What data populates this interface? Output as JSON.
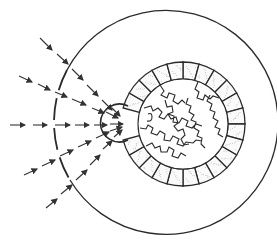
{
  "diagram": {
    "title": "",
    "colors": {
      "line": "#2a2a2a",
      "arrow": "#333333",
      "background": "#ffffff",
      "stipple": "#9a9a9a"
    },
    "outer_envelope": {
      "cx": 172,
      "cy": 122,
      "r": 112,
      "dashed_side": "left"
    },
    "capture_sphere": {
      "cx": 118,
      "cy": 122,
      "r": 19
    },
    "ring": {
      "cx": 183,
      "cy": 124,
      "r_outer": 62,
      "r_inner": 45,
      "segment_count": 24,
      "stippled": true
    },
    "inner_cells": {
      "count": 14,
      "style": "jigsaw-like"
    },
    "arrow_streams": [
      {
        "name": "upper-steep",
        "from": [
          40,
          38
        ],
        "to": [
          116,
          112
        ]
      },
      {
        "name": "upper",
        "from": [
          20,
          56
        ],
        "to": [
          118,
          116
        ]
      },
      {
        "name": "horizontal",
        "from": [
          10,
          125
        ],
        "to": [
          126,
          122
        ]
      },
      {
        "name": "lower",
        "from": [
          22,
          172
        ],
        "to": [
          120,
          128
        ]
      },
      {
        "name": "lower-steep",
        "from": [
          45,
          208
        ],
        "to": [
          122,
          132
        ]
      }
    ]
  }
}
